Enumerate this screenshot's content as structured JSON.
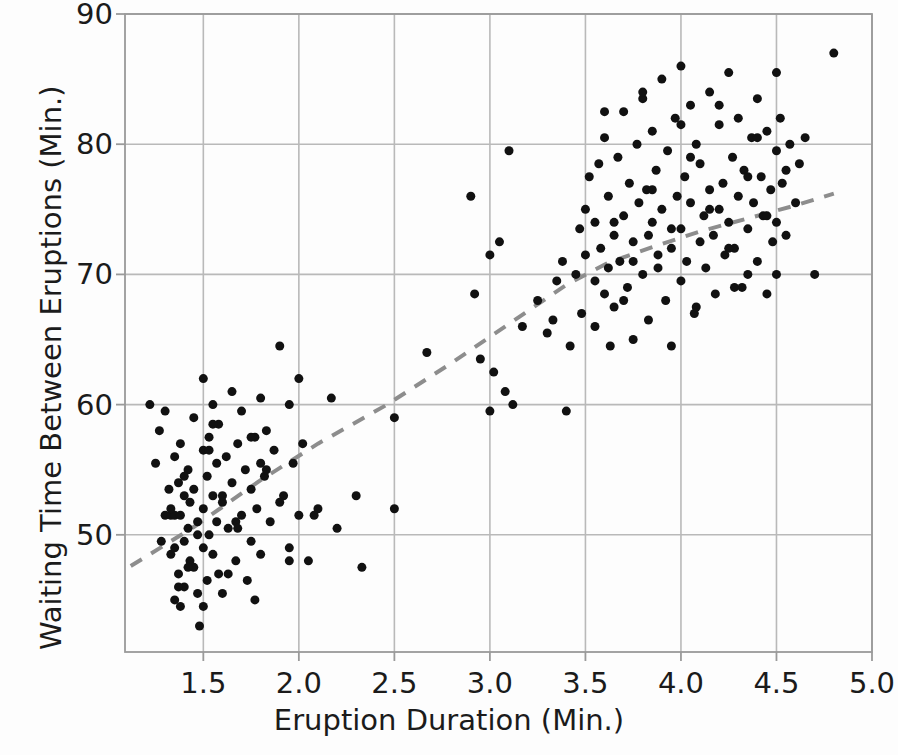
{
  "chart_data": {
    "type": "scatter",
    "title": "",
    "xlabel": "Eruption Duration (Min.)",
    "ylabel": "Waiting Time Between Eruptions (Min.)",
    "xlim": [
      1.09,
      5.0
    ],
    "ylim": [
      41.0,
      90.0
    ],
    "xticks": [
      "1.5",
      "2.0",
      "2.5",
      "3.0",
      "3.5",
      "4.0",
      "4.5",
      "5.0"
    ],
    "xtick_values": [
      1.5,
      2.0,
      2.5,
      3.0,
      3.5,
      4.0,
      4.5,
      5.0
    ],
    "yticks": [
      "50",
      "60",
      "70",
      "80",
      "90"
    ],
    "ytick_values": [
      50,
      60,
      70,
      80,
      90
    ],
    "grid": true,
    "legend": "none",
    "marker_color": "#111111",
    "marker_size_px": 9,
    "grid_color": "#b9b9b9",
    "frame_color": "#9a9a9a",
    "background": "#fdfdfd",
    "trend": {
      "style": "dashed",
      "color": "#8d8d8d",
      "width_px": 4,
      "dash": "13,11",
      "points": [
        [
          1.12,
          47.6
        ],
        [
          1.45,
          50.6
        ],
        [
          1.8,
          54.2
        ],
        [
          2.1,
          57.0
        ],
        [
          2.45,
          59.9
        ],
        [
          2.8,
          63.2
        ],
        [
          3.1,
          66.2
        ],
        [
          3.4,
          69.2
        ],
        [
          3.62,
          70.9
        ],
        [
          3.85,
          72.1
        ],
        [
          4.1,
          73.3
        ],
        [
          4.35,
          74.3
        ],
        [
          4.6,
          75.3
        ],
        [
          4.8,
          76.2
        ]
      ]
    },
    "x": [
      1.22,
      1.25,
      1.27,
      1.3,
      1.3,
      1.32,
      1.33,
      1.33,
      1.35,
      1.35,
      1.35,
      1.35,
      1.37,
      1.37,
      1.38,
      1.38,
      1.38,
      1.4,
      1.4,
      1.4,
      1.42,
      1.42,
      1.43,
      1.43,
      1.45,
      1.45,
      1.45,
      1.47,
      1.47,
      1.48,
      1.5,
      1.5,
      1.5,
      1.5,
      1.52,
      1.52,
      1.53,
      1.53,
      1.55,
      1.55,
      1.55,
      1.57,
      1.57,
      1.58,
      1.58,
      1.6,
      1.6,
      1.62,
      1.63,
      1.65,
      1.65,
      1.67,
      1.68,
      1.7,
      1.7,
      1.72,
      1.73,
      1.75,
      1.75,
      1.77,
      1.78,
      1.8,
      1.8,
      1.82,
      1.83,
      1.85,
      1.87,
      1.9,
      1.92,
      1.95,
      1.95,
      1.97,
      2.0,
      2.0,
      2.02,
      2.05,
      2.1,
      2.17,
      2.2,
      2.3,
      2.33,
      2.5,
      2.5,
      2.67,
      2.9,
      2.92,
      2.95,
      3.0,
      3.0,
      3.02,
      3.05,
      3.08,
      3.1,
      3.12,
      3.17,
      3.25,
      3.3,
      3.33,
      3.35,
      3.38,
      3.4,
      3.42,
      3.45,
      3.47,
      3.48,
      3.5,
      3.5,
      3.52,
      3.55,
      3.55,
      3.57,
      3.58,
      3.6,
      3.6,
      3.62,
      3.62,
      3.63,
      3.65,
      3.65,
      3.67,
      3.68,
      3.7,
      3.7,
      3.72,
      3.73,
      3.75,
      3.75,
      3.77,
      3.78,
      3.8,
      3.8,
      3.82,
      3.83,
      3.83,
      3.85,
      3.85,
      3.87,
      3.88,
      3.9,
      3.9,
      3.92,
      3.93,
      3.95,
      3.95,
      3.97,
      3.98,
      4.0,
      4.0,
      4.0,
      4.02,
      4.03,
      4.05,
      4.05,
      4.07,
      4.08,
      4.1,
      4.1,
      4.12,
      4.13,
      4.15,
      4.15,
      4.17,
      4.18,
      4.2,
      4.2,
      4.22,
      4.23,
      4.25,
      4.25,
      4.27,
      4.28,
      4.3,
      4.3,
      4.32,
      4.33,
      4.35,
      4.35,
      4.37,
      4.38,
      4.4,
      4.4,
      4.42,
      4.43,
      4.45,
      4.45,
      4.47,
      4.48,
      4.5,
      4.5,
      4.5,
      4.5,
      4.52,
      4.53,
      4.55,
      4.57,
      4.6,
      4.62,
      4.65,
      4.7,
      4.8,
      1.28,
      1.33,
      1.4,
      1.47,
      1.53,
      1.6,
      1.67,
      1.75,
      1.83,
      1.9,
      3.55,
      3.65,
      3.75,
      3.85,
      3.95,
      4.05,
      4.15,
      4.25,
      4.35,
      4.45,
      1.42,
      1.55,
      1.68,
      1.8,
      1.95,
      2.08,
      3.7,
      3.88,
      4.08,
      4.28,
      1.37,
      1.5,
      1.63,
      1.77,
      3.6,
      3.8,
      4.0,
      4.2,
      4.4,
      4.55
    ],
    "y": [
      60.0,
      55.5,
      58.0,
      59.5,
      51.5,
      53.5,
      51.5,
      48.5,
      56.0,
      51.5,
      49.0,
      45.0,
      54.0,
      47.0,
      57.0,
      51.5,
      44.5,
      53.0,
      49.5,
      46.0,
      55.0,
      50.5,
      52.5,
      48.0,
      59.0,
      53.5,
      47.5,
      51.0,
      45.5,
      43.0,
      62.0,
      56.5,
      52.0,
      49.0,
      54.5,
      46.5,
      57.5,
      50.0,
      60.0,
      53.0,
      48.5,
      55.5,
      51.0,
      58.5,
      47.0,
      52.5,
      45.5,
      56.0,
      50.5,
      61.0,
      54.0,
      48.0,
      57.0,
      59.5,
      51.5,
      55.0,
      46.5,
      53.5,
      49.5,
      57.5,
      52.0,
      60.5,
      48.5,
      54.5,
      58.0,
      51.0,
      56.5,
      64.5,
      53.0,
      60.0,
      49.0,
      55.5,
      62.0,
      51.5,
      57.0,
      48.0,
      52.0,
      60.5,
      50.5,
      53.0,
      47.5,
      59.0,
      52.0,
      64.0,
      76.0,
      68.5,
      63.5,
      71.5,
      59.5,
      62.5,
      72.5,
      61.0,
      79.5,
      60.0,
      66.0,
      68.0,
      65.5,
      66.5,
      69.5,
      71.0,
      59.5,
      64.5,
      70.0,
      73.5,
      67.0,
      75.0,
      71.5,
      77.5,
      74.0,
      66.0,
      78.5,
      72.0,
      80.5,
      68.5,
      76.0,
      70.5,
      64.5,
      73.0,
      67.5,
      79.0,
      71.0,
      82.5,
      74.5,
      69.0,
      77.0,
      72.5,
      65.0,
      80.0,
      75.5,
      83.5,
      70.0,
      76.5,
      73.0,
      66.5,
      81.0,
      74.0,
      78.0,
      71.5,
      85.0,
      75.0,
      68.0,
      79.5,
      72.0,
      64.5,
      82.0,
      76.0,
      86.0,
      73.5,
      69.5,
      77.5,
      71.0,
      83.0,
      75.5,
      67.0,
      80.0,
      72.5,
      78.5,
      74.5,
      70.5,
      84.0,
      76.5,
      73.0,
      68.5,
      81.5,
      75.0,
      77.0,
      71.5,
      85.5,
      74.0,
      79.0,
      72.0,
      82.0,
      76.0,
      69.0,
      78.0,
      73.5,
      70.0,
      80.5,
      75.5,
      83.5,
      71.0,
      77.5,
      74.5,
      81.0,
      68.5,
      76.5,
      72.5,
      85.5,
      79.5,
      74.0,
      70.0,
      82.0,
      77.0,
      73.0,
      80.0,
      75.5,
      78.5,
      80.5,
      70.0,
      87.0,
      49.5,
      52.0,
      54.5,
      50.0,
      56.5,
      53.0,
      51.0,
      57.5,
      55.0,
      52.5,
      69.5,
      74.0,
      71.0,
      76.5,
      73.5,
      79.0,
      75.0,
      72.0,
      77.5,
      74.5,
      47.5,
      58.5,
      50.5,
      55.5,
      48.0,
      51.5,
      68.0,
      70.5,
      67.5,
      69.0,
      46.0,
      44.5,
      47.0,
      45.0,
      82.5,
      84.0,
      81.5,
      83.0,
      80.5,
      78.0
    ]
  },
  "geometry": {
    "plot_left": 125,
    "plot_right": 872,
    "plot_top": 14,
    "plot_bottom": 652
  }
}
